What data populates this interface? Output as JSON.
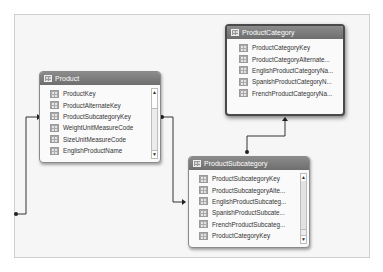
{
  "tables": {
    "product": {
      "title": "Product",
      "columns": [
        "ProductKey",
        "ProductAlternateKey",
        "ProductSubcategoryKey",
        "WeightUnitMeasureCode",
        "SizeUnitMeasureCode",
        "EnglishProductName"
      ]
    },
    "product_category": {
      "title": "ProductCategory",
      "columns": [
        "ProductCategoryKey",
        "ProductCategoryAlternate...",
        "EnglishProductCategoryNa...",
        "SpanishProductCategoryN...",
        "FrenchProductCategoryNa..."
      ]
    },
    "product_subcategory": {
      "title": "ProductSubcategory",
      "columns": [
        "ProductSubcategoryKey",
        "ProductSubcategoryAlte...",
        "EnglishProductSubcateg...",
        "SpanishProductSubcate...",
        "FrenchProductSubcateg...",
        "ProductCategoryKey"
      ]
    }
  },
  "scroll": {
    "up": "▲",
    "down": "▼"
  },
  "colors": {
    "header": "#7a7a7a",
    "canvas": "#f6f6f6",
    "line": "#333333"
  }
}
